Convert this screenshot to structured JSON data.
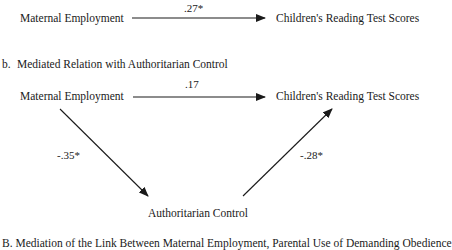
{
  "panel_a": {
    "source_node": "Maternal Employment",
    "target_node": "Children's Reading Test Scores",
    "direct_coef": ".27*"
  },
  "panel_b": {
    "label": "b.",
    "title": "Mediated Relation with Authoritarian Control",
    "source_node": "Maternal Employment",
    "target_node": "Children's Reading Test Scores",
    "mediator_node": "Authoritarian Control",
    "direct_coef": ".17",
    "source_to_mediator_coef": "-.35*",
    "mediator_to_target_coef": "-.28*"
  },
  "next_section": {
    "caption": "B.  Mediation of the Link Between Maternal Employment, Parental Use of Demanding Obedience"
  },
  "colors": {
    "ink": "#1a1a1a",
    "background": "#ffffff"
  }
}
